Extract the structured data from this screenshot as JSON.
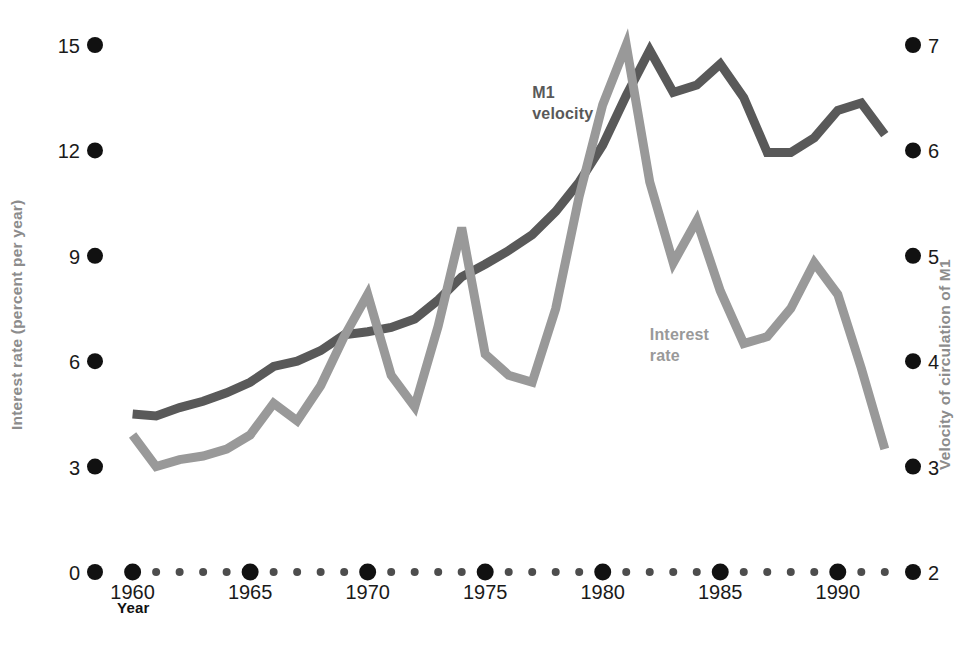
{
  "chart_data": {
    "type": "line",
    "title": "",
    "subtitle": "",
    "xlabel": "Year",
    "ylabel": "Interest rate (percent per year)",
    "y2label": "Velocity of circulation of M1",
    "xlim": [
      1958.4,
      1993.2
    ],
    "ylim": [
      0,
      15
    ],
    "y2lim": [
      2,
      7
    ],
    "grid": false,
    "legend_position": "inline-annotations",
    "x_major_ticks": [
      1960,
      1965,
      1970,
      1975,
      1980,
      1985,
      1990
    ],
    "x_minor_ticks": [
      1961,
      1962,
      1963,
      1964,
      1966,
      1967,
      1968,
      1969,
      1971,
      1972,
      1973,
      1974,
      1976,
      1977,
      1978,
      1979,
      1981,
      1982,
      1983,
      1984,
      1986,
      1987,
      1988,
      1989,
      1991,
      1992
    ],
    "x_tick_labels": [
      "1960",
      "1965",
      "1970",
      "1975",
      "1980",
      "1985",
      "1990"
    ],
    "y_ticks": [
      0,
      3,
      6,
      9,
      12,
      15
    ],
    "y_tick_labels": [
      "0",
      "3",
      "6",
      "9",
      "12",
      "15"
    ],
    "y2_ticks": [
      2,
      3,
      4,
      5,
      6,
      7
    ],
    "y2_tick_labels": [
      "2",
      "3",
      "4",
      "5",
      "6",
      "7"
    ],
    "x": [
      1960,
      1961,
      1962,
      1963,
      1964,
      1965,
      1966,
      1967,
      1968,
      1969,
      1970,
      1971,
      1972,
      1973,
      1974,
      1975,
      1976,
      1977,
      1978,
      1979,
      1980,
      1981,
      1982,
      1983,
      1984,
      1985,
      1986,
      1987,
      1988,
      1989,
      1990,
      1991,
      1992
    ],
    "series": [
      {
        "name": "M1 velocity",
        "axis": "right",
        "color": "#595959",
        "values": [
          3.5,
          3.48,
          3.56,
          3.62,
          3.7,
          3.8,
          3.95,
          4.0,
          4.1,
          4.25,
          4.28,
          4.32,
          4.4,
          4.58,
          4.8,
          4.92,
          5.05,
          5.2,
          5.42,
          5.7,
          6.05,
          6.52,
          6.95,
          6.55,
          6.62,
          6.82,
          6.5,
          5.98,
          5.98,
          6.12,
          6.38,
          6.45,
          6.15
        ]
      },
      {
        "name": "Interest rate",
        "axis": "left",
        "color": "#999999",
        "values": [
          3.9,
          3.0,
          3.2,
          3.3,
          3.5,
          3.9,
          4.8,
          4.3,
          5.3,
          6.7,
          7.9,
          5.6,
          4.7,
          7.0,
          9.8,
          6.2,
          5.6,
          5.4,
          7.5,
          10.7,
          13.3,
          15.0,
          11.1,
          8.8,
          10.0,
          8.0,
          6.5,
          6.7,
          7.5,
          8.8,
          7.9,
          5.8,
          3.5
        ]
      }
    ],
    "annotations": [
      {
        "text": "M1 velocity",
        "lines": [
          "M1",
          "velocity"
        ],
        "x": 1977.0,
        "y": 13.5
      },
      {
        "text": "Interest rate",
        "lines": [
          "Interest",
          "rate"
        ],
        "x": 1982.0,
        "y": 6.6
      }
    ]
  },
  "axes": {
    "left_title": "Interest rate (percent per year)",
    "right_title": "Velocity of circulation of M1",
    "x_title": "Year"
  },
  "colors": {
    "velocity_line": "#595959",
    "interest_line": "#999999",
    "tick_dot": "#111111",
    "axis_label_gray": "#8c8c8c",
    "background": "#ffffff"
  }
}
